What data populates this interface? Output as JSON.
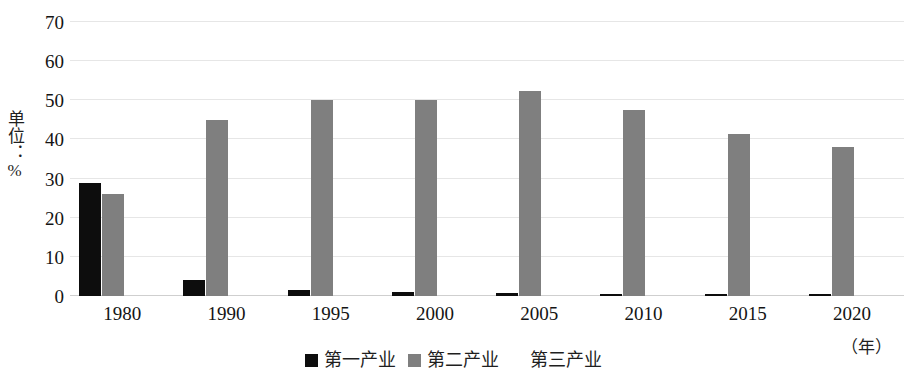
{
  "chart_data": {
    "type": "bar",
    "title": "",
    "subtitle": "",
    "xlabel": "（年）",
    "ylabel": "单位：%",
    "categories": [
      "1980",
      "1990",
      "1995",
      "2000",
      "2005",
      "2010",
      "2015",
      "2020"
    ],
    "series": [
      {
        "name": "第一产业",
        "color": "#0d0d0d",
        "values": [
          29,
          4,
          1.5,
          1,
          0.7,
          0.5,
          0.4,
          0.3
        ]
      },
      {
        "name": "第二产业",
        "color": "#7f7f7f",
        "values": [
          26,
          45,
          50,
          50,
          52.5,
          47.5,
          41.5,
          38
        ]
      },
      {
        "name": "第三产业",
        "color": "#ffffff",
        "values": [
          0,
          0,
          0,
          0,
          0,
          0,
          0,
          0
        ]
      }
    ],
    "ylim": [
      0,
      70
    ],
    "yticks": [
      0,
      10,
      20,
      30,
      40,
      50,
      60,
      70
    ],
    "grid": true,
    "legend_position": "bottom"
  },
  "axes": {
    "y_title": "单位：%",
    "y_ticks": [
      "70",
      "60",
      "50",
      "40",
      "30",
      "20",
      "10",
      "0"
    ],
    "x_ticks": [
      "1980",
      "1990",
      "1995",
      "2000",
      "2005",
      "2010",
      "2015",
      "2020"
    ],
    "x_unit": "（年）"
  },
  "legend": {
    "items": [
      {
        "label": "第一产业",
        "color": "#0d0d0d"
      },
      {
        "label": "第二产业",
        "color": "#7f7f7f"
      },
      {
        "label": "第三产业",
        "color": "#ffffff"
      }
    ]
  }
}
